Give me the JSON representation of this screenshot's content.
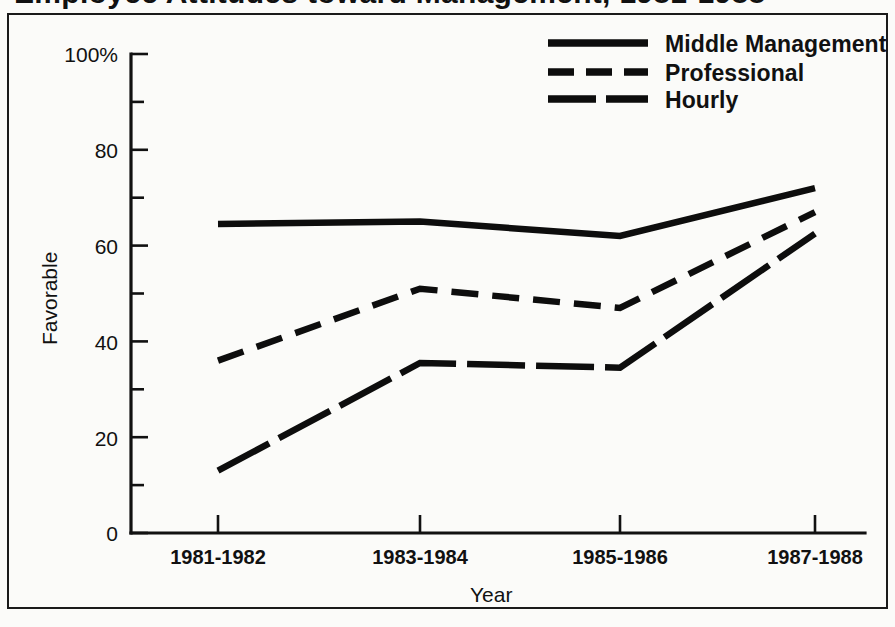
{
  "figure": {
    "title_partial": "Employee Attitudes toward Management, 1981-1988",
    "background_color": "#fbfbf9",
    "ink_color": "#0d0d0d",
    "border_color": "#1a1a1a"
  },
  "axes": {
    "y_label": "Favorable",
    "x_label": "Year",
    "y_ticks": [
      "100%",
      "80",
      "60",
      "40",
      "20",
      "0"
    ],
    "y_tick_values": [
      100,
      80,
      60,
      40,
      20,
      0
    ],
    "y_minor_values": [
      90,
      70,
      50,
      30,
      10
    ],
    "x_ticks": [
      "1981-1982",
      "1983-1984",
      "1985-1986",
      "1987-1988"
    ]
  },
  "legend": {
    "position": "top-right",
    "entries": [
      {
        "label": "Middle Management",
        "style": "solid"
      },
      {
        "label": "Professional",
        "style": "dashed-medium"
      },
      {
        "label": "Hourly",
        "style": "dashed-long"
      }
    ]
  },
  "chart_data": {
    "type": "line",
    "title": "Employee Attitudes toward Management, 1981-1988",
    "xlabel": "Year",
    "ylabel": "Favorable",
    "categories": [
      "1981-1982",
      "1983-1984",
      "1985-1986",
      "1987-1988"
    ],
    "ylim": [
      0,
      100
    ],
    "xlim_categorical": true,
    "grid": false,
    "legend_position": "top-right",
    "y_tick_labels": [
      "0",
      "20",
      "40",
      "60",
      "80",
      "100%"
    ],
    "y_major_ticks": [
      0,
      20,
      40,
      60,
      80,
      100
    ],
    "y_minor_ticks": [
      10,
      30,
      50,
      70,
      90
    ],
    "series": [
      {
        "name": "Middle Management",
        "style": "solid",
        "values": [
          64.5,
          65,
          62,
          72
        ]
      },
      {
        "name": "Professional",
        "style": "dashed-medium",
        "values": [
          36,
          51,
          47,
          67
        ]
      },
      {
        "name": "Hourly",
        "style": "dashed-long",
        "values": [
          13,
          35.5,
          34.5,
          62.5
        ]
      }
    ]
  }
}
